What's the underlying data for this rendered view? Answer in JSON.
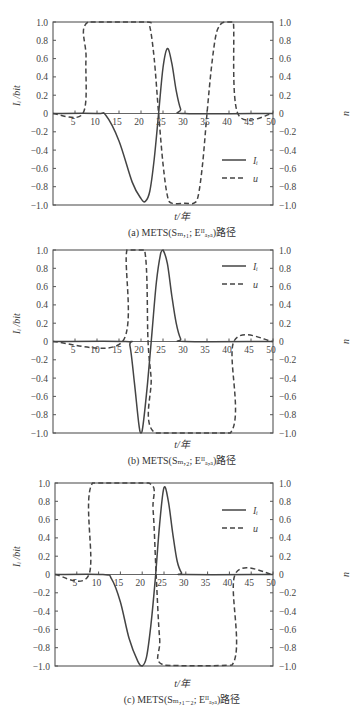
{
  "figure": {
    "panels": [
      {
        "id": "a",
        "caption": "(a)  METS(Sₘ,₁; Eᴵᴵₐ,ₐ)路径",
        "xlabel": "t/年",
        "ylabel_left": "Iᵢ /bit",
        "ylabel_right": "u",
        "legend": [
          {
            "label": "Iᵢ",
            "style": "solid"
          },
          {
            "label": "u",
            "style": "dashed"
          }
        ]
      },
      {
        "id": "b",
        "caption": "(b)  METS(Sₘ,₂; Eᴵᴵₐ,ₐ)路径",
        "xlabel": "t/年",
        "ylabel_left": "Iᵢ /bit",
        "ylabel_right": "u",
        "legend": [
          {
            "label": "Iᵢ",
            "style": "solid"
          },
          {
            "label": "u",
            "style": "dashed"
          }
        ]
      },
      {
        "id": "c",
        "caption": "(c)  METS(Sₘ,₁₋₂; Eᴵᴵₐ,ₐ)路径",
        "xlabel": "t/年",
        "ylabel_left": "Iᵢ /bit",
        "ylabel_right": "u",
        "legend": [
          {
            "label": "Iᵢ",
            "style": "solid"
          },
          {
            "label": "u",
            "style": "dashed"
          }
        ]
      }
    ],
    "x_ticks": [
      "5",
      "10",
      "15",
      "20",
      "25",
      "30",
      "35",
      "40",
      "45",
      "50"
    ],
    "y_ticks": [
      "1.0",
      "0.8",
      "0.6",
      "0.4",
      "0.2",
      "0",
      "−0.2",
      "−0.4",
      "−0.6",
      "−0.8",
      "−1.0"
    ]
  },
  "chart_data": [
    {
      "type": "line",
      "title": "(a) METS(S_m,1; E^II_a,a)路径",
      "xlabel": "t/年",
      "ylabel": "I_i /bit",
      "ylabel_right": "u",
      "xlim": [
        0,
        50
      ],
      "ylim": [
        -1.0,
        1.0
      ],
      "grid": false,
      "legend_position": "lower right",
      "series": [
        {
          "name": "I_i",
          "style": "solid",
          "x": [
            0,
            10,
            12,
            15,
            18,
            20,
            21,
            22,
            23,
            24,
            25,
            26,
            27,
            28,
            29,
            30,
            50
          ],
          "y": [
            0,
            0,
            -0.02,
            -0.3,
            -0.75,
            -0.93,
            -0.96,
            -0.85,
            -0.5,
            0.0,
            0.5,
            0.71,
            0.55,
            0.25,
            0.05,
            0,
            0
          ]
        },
        {
          "name": "u",
          "style": "dashed",
          "x": [
            0,
            6.8,
            7.5,
            8,
            21,
            22,
            23,
            24,
            25,
            26,
            27,
            30,
            32,
            33,
            34,
            35,
            36,
            37,
            38,
            39,
            40,
            41,
            42,
            50
          ],
          "y": [
            0,
            0,
            0.6,
            1.0,
            1.0,
            0.95,
            0.6,
            0.0,
            -0.55,
            -0.9,
            -0.98,
            -0.98,
            -0.98,
            -0.9,
            -0.55,
            0.0,
            0.5,
            0.85,
            0.97,
            1.0,
            1.0,
            1.0,
            0,
            0
          ]
        }
      ]
    },
    {
      "type": "line",
      "title": "(b) METS(S_m,2; E^II_a,a)路径",
      "xlabel": "t/年",
      "ylabel": "I_i /bit",
      "ylabel_right": "u",
      "xlim": [
        0,
        50
      ],
      "ylim": [
        -1.0,
        1.0
      ],
      "grid": false,
      "legend_position": "upper right",
      "series": [
        {
          "name": "I_i",
          "style": "solid",
          "x": [
            0,
            16.5,
            17.5,
            18.5,
            19.5,
            20,
            20.5,
            21.5,
            22.5,
            23.5,
            24.5,
            25,
            26,
            27,
            28,
            29,
            30,
            50
          ],
          "y": [
            0,
            0,
            -0.05,
            -0.45,
            -0.9,
            -1.0,
            -0.9,
            -0.45,
            0.1,
            0.65,
            0.97,
            1.0,
            0.85,
            0.5,
            0.2,
            0.03,
            0,
            0
          ]
        },
        {
          "name": "u",
          "style": "dashed",
          "x": [
            0,
            15.8,
            16.8,
            20.8,
            21.6,
            22.3,
            23.2,
            40.3,
            41.1,
            50
          ],
          "y": [
            0,
            0,
            1.0,
            1.0,
            0.0,
            -0.4,
            -1.0,
            -1.0,
            0,
            0
          ]
        }
      ]
    },
    {
      "type": "line",
      "title": "(c) METS(S_m,1-2; E^II_a,a)路径",
      "xlabel": "t/年",
      "ylabel": "I_i /bit",
      "ylabel_right": "u",
      "xlim": [
        0,
        50
      ],
      "ylim": [
        -1.0,
        1.0
      ],
      "grid": false,
      "legend_position": "upper right",
      "series": [
        {
          "name": "I_i",
          "style": "solid",
          "x": [
            0,
            11,
            13,
            15,
            17,
            19,
            20,
            21,
            22,
            23,
            24,
            25,
            26,
            27,
            28,
            29,
            30,
            50
          ],
          "y": [
            0,
            0,
            -0.05,
            -0.3,
            -0.7,
            -0.95,
            -1.0,
            -0.9,
            -0.55,
            -0.05,
            0.55,
            0.95,
            0.8,
            0.45,
            0.15,
            0.02,
            0,
            0
          ]
        },
        {
          "name": "u",
          "style": "dashed",
          "x": [
            0,
            7.8,
            8.6,
            21.5,
            22.5,
            23.2,
            24,
            25,
            40.6,
            41.3,
            50
          ],
          "y": [
            0,
            0,
            1.0,
            1.0,
            0.7,
            0.0,
            -0.7,
            -0.99,
            -0.99,
            0,
            0
          ]
        }
      ]
    }
  ]
}
